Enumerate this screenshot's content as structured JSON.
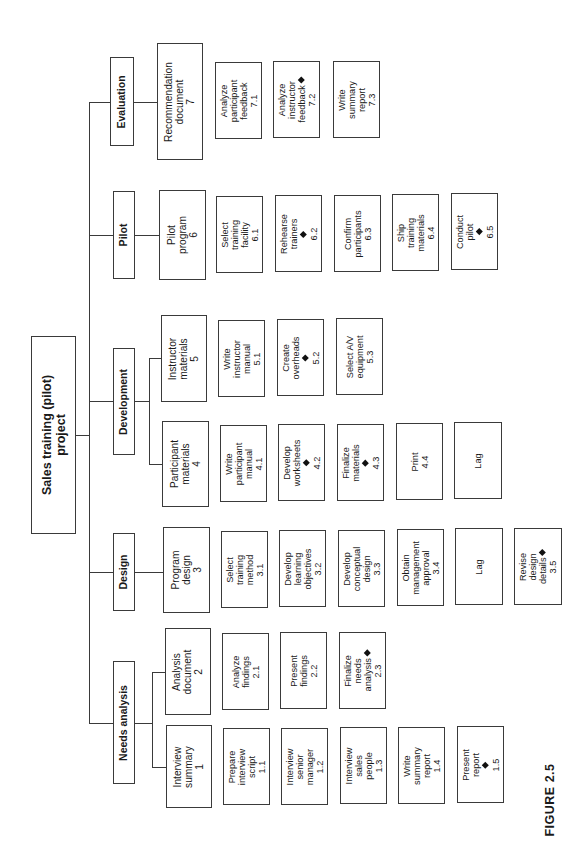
{
  "root": {
    "lines": [
      "Sales training (pilot)",
      "project"
    ]
  },
  "figure_label": "FIGURE 2.5",
  "milestone_icon": "diamond-milestone-icon",
  "phases": [
    {
      "label": "Needs analysis",
      "deliverables": [
        {
          "lines": [
            "Interview",
            "summary",
            "1"
          ],
          "tasks": [
            {
              "lines": [
                "Prepare",
                "interview",
                "script",
                "1.1"
              ],
              "milestone": false
            },
            {
              "lines": [
                "Interview",
                "senior",
                "manager",
                "1.2"
              ],
              "milestone": false
            },
            {
              "lines": [
                "Interview",
                "sales",
                "people",
                "1.3"
              ],
              "milestone": false
            },
            {
              "lines": [
                "Write",
                "summary",
                "report",
                "1.4"
              ],
              "milestone": false
            },
            {
              "lines": [
                "Present",
                "report",
                "1.5"
              ],
              "milestone": true
            }
          ]
        },
        {
          "lines": [
            "Analysis",
            "document",
            "2"
          ],
          "tasks": [
            {
              "lines": [
                "Analyze",
                "findings",
                "2.1"
              ],
              "milestone": false
            },
            {
              "lines": [
                "Present",
                "findings",
                "2.2"
              ],
              "milestone": false
            },
            {
              "lines": [
                "Finalize",
                "needs",
                "analysis",
                "2.3"
              ],
              "milestone": true
            }
          ]
        }
      ]
    },
    {
      "label": "Design",
      "deliverables": [
        {
          "lines": [
            "Program",
            "design",
            "3"
          ],
          "tasks": [
            {
              "lines": [
                "Select",
                "training",
                "method",
                "3.1"
              ],
              "milestone": false
            },
            {
              "lines": [
                "Develop",
                "learning",
                "objectives",
                "3.2"
              ],
              "milestone": false
            },
            {
              "lines": [
                "Develop",
                "conceptual",
                "design",
                "3.3"
              ],
              "milestone": false
            },
            {
              "lines": [
                "Obtain",
                "management",
                "approval",
                "3.4"
              ],
              "milestone": false
            },
            {
              "lines": [
                "Lag"
              ],
              "milestone": false
            },
            {
              "lines": [
                "Revise",
                "design",
                "details",
                "3.5"
              ],
              "milestone": true
            }
          ]
        }
      ]
    },
    {
      "label": "Development",
      "deliverables": [
        {
          "lines": [
            "Participant",
            "materials",
            "4"
          ],
          "tasks": [
            {
              "lines": [
                "Write",
                "participant",
                "manual",
                "4.1"
              ],
              "milestone": false
            },
            {
              "lines": [
                "Develop",
                "worksheets",
                "4.2"
              ],
              "milestone": true
            },
            {
              "lines": [
                "Finalize",
                "materials",
                "4.3"
              ],
              "milestone": true
            },
            {
              "lines": [
                "Print",
                "4.4"
              ],
              "milestone": false
            },
            {
              "lines": [
                "Lag"
              ],
              "milestone": false
            }
          ]
        },
        {
          "lines": [
            "Instructor",
            "materials",
            "5"
          ],
          "tasks": [
            {
              "lines": [
                "Write",
                "instructor",
                "manual",
                "5.1"
              ],
              "milestone": false
            },
            {
              "lines": [
                "Create",
                "overheads",
                "5.2"
              ],
              "milestone": true
            },
            {
              "lines": [
                "Select A/V",
                "equipment",
                "5.3"
              ],
              "milestone": false
            }
          ]
        }
      ]
    },
    {
      "label": "Pilot",
      "deliverables": [
        {
          "lines": [
            "Pilot",
            "program",
            "6"
          ],
          "tasks": [
            {
              "lines": [
                "Select",
                "training",
                "facility",
                "6.1"
              ],
              "milestone": false
            },
            {
              "lines": [
                "Rehearse",
                "trainers",
                "6.2"
              ],
              "milestone": true
            },
            {
              "lines": [
                "Confirm",
                "participants",
                "6.3"
              ],
              "milestone": false
            },
            {
              "lines": [
                "Ship",
                "training",
                "materials",
                "6.4"
              ],
              "milestone": false
            },
            {
              "lines": [
                "Conduct",
                "pilot",
                "6.5"
              ],
              "milestone": true
            }
          ]
        }
      ]
    },
    {
      "label": "Evaluation",
      "deliverables": [
        {
          "lines": [
            "Recommendation",
            "document",
            "7"
          ],
          "tasks": [
            {
              "lines": [
                "Analyze",
                "participant",
                "feedback",
                "7.1"
              ],
              "milestone": false
            },
            {
              "lines": [
                "Analyze",
                "instructor",
                "feedback",
                "7.2"
              ],
              "milestone": true
            },
            {
              "lines": [
                "Write",
                "summary",
                "report",
                "7.3"
              ],
              "milestone": false
            }
          ]
        }
      ]
    }
  ]
}
